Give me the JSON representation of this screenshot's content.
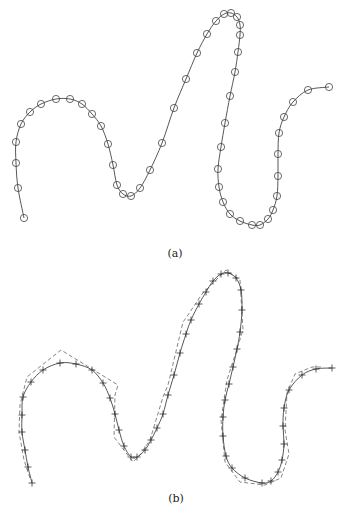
{
  "figure": {
    "panels": [
      {
        "id": "a",
        "caption": "(a)",
        "caption_pos": [
          175,
          255
        ],
        "description": "Smooth curve with circle markers at sample points",
        "curve_points": [
          [
            24,
            218
          ],
          [
            18,
            188
          ],
          [
            16,
            163
          ],
          [
            16,
            142
          ],
          [
            21,
            124
          ],
          [
            30,
            112
          ],
          [
            41,
            104
          ],
          [
            56,
            99
          ],
          [
            70,
            99
          ],
          [
            82,
            104
          ],
          [
            92,
            114
          ],
          [
            101,
            126
          ],
          [
            108,
            144
          ],
          [
            113,
            165
          ],
          [
            117,
            185
          ],
          [
            123,
            194
          ],
          [
            131,
            196
          ],
          [
            140,
            188
          ],
          [
            150,
            170
          ],
          [
            162,
            143
          ],
          [
            174,
            108
          ],
          [
            186,
            79
          ],
          [
            197,
            53
          ],
          [
            207,
            34
          ],
          [
            216,
            21
          ],
          [
            224,
            14
          ],
          [
            231,
            13
          ],
          [
            237,
            17
          ],
          [
            240,
            25
          ],
          [
            240,
            35
          ],
          [
            238,
            52
          ],
          [
            235,
            72
          ],
          [
            230,
            96
          ],
          [
            225,
            123
          ],
          [
            221,
            147
          ],
          [
            218,
            169
          ],
          [
            219,
            187
          ],
          [
            223,
            202
          ],
          [
            230,
            214
          ],
          [
            240,
            221
          ],
          [
            252,
            225
          ],
          [
            260,
            225
          ],
          [
            268,
            219
          ],
          [
            273,
            210
          ],
          [
            277,
            196
          ],
          [
            278,
            176
          ],
          [
            278,
            154
          ],
          [
            279,
            133
          ],
          [
            284,
            117
          ],
          [
            293,
            102
          ],
          [
            308,
            90
          ],
          [
            329,
            87
          ]
        ],
        "marker": "circle",
        "marker_radius": 3.6
      },
      {
        "id": "b",
        "caption": "(b)",
        "caption_pos": [
          176,
          500
        ],
        "description": "Smooth curve with cross markers and dashed approximating polygon",
        "curve_points": [
          [
            32,
            483
          ],
          [
            28,
            467
          ],
          [
            25,
            450
          ],
          [
            22,
            432
          ],
          [
            22,
            415
          ],
          [
            23,
            397
          ],
          [
            31,
            382
          ],
          [
            43,
            370
          ],
          [
            60,
            363
          ],
          [
            76,
            364
          ],
          [
            92,
            370
          ],
          [
            103,
            383
          ],
          [
            110,
            398
          ],
          [
            115,
            414
          ],
          [
            119,
            430
          ],
          [
            124,
            446
          ],
          [
            131,
            457
          ],
          [
            137,
            457
          ],
          [
            145,
            450
          ],
          [
            151,
            440
          ],
          [
            157,
            428
          ],
          [
            163,
            414
          ],
          [
            168,
            395
          ],
          [
            174,
            375
          ],
          [
            180,
            353
          ],
          [
            186,
            334
          ],
          [
            191,
            320
          ],
          [
            199,
            304
          ],
          [
            206,
            292
          ],
          [
            213,
            281
          ],
          [
            221,
            274
          ],
          [
            228,
            273
          ],
          [
            236,
            278
          ],
          [
            241,
            290
          ],
          [
            242,
            310
          ],
          [
            240,
            332
          ],
          [
            237,
            349
          ],
          [
            233,
            367
          ],
          [
            229,
            384
          ],
          [
            225,
            400
          ],
          [
            223,
            417
          ],
          [
            223,
            436
          ],
          [
            226,
            456
          ],
          [
            232,
            468
          ],
          [
            245,
            478
          ],
          [
            262,
            483
          ],
          [
            271,
            481
          ],
          [
            278,
            472
          ],
          [
            282,
            460
          ],
          [
            284,
            444
          ],
          [
            283,
            426
          ],
          [
            284,
            408
          ],
          [
            289,
            390
          ],
          [
            302,
            375
          ],
          [
            316,
            369
          ],
          [
            332,
            368
          ]
        ],
        "dashed_polygon": [
          [
            30,
            478
          ],
          [
            24,
            460
          ],
          [
            19,
            432
          ],
          [
            20,
            405
          ],
          [
            27,
            377
          ],
          [
            61,
            350
          ],
          [
            118,
            385
          ],
          [
            115,
            395
          ],
          [
            114,
            437
          ],
          [
            133,
            462
          ],
          [
            140,
            455
          ],
          [
            150,
            440
          ],
          [
            163,
            397
          ],
          [
            168,
            385
          ],
          [
            183,
            322
          ],
          [
            186,
            318
          ],
          [
            202,
            294
          ],
          [
            226,
            270
          ],
          [
            240,
            280
          ],
          [
            243,
            330
          ],
          [
            227,
            380
          ],
          [
            221,
            420
          ],
          [
            225,
            462
          ],
          [
            240,
            482
          ],
          [
            265,
            485
          ],
          [
            281,
            478
          ],
          [
            289,
            454
          ],
          [
            285,
            430
          ],
          [
            287,
            393
          ],
          [
            295,
            374
          ],
          [
            312,
            367
          ],
          [
            322,
            367
          ]
        ],
        "marker": "cross",
        "marker_size": 3.5
      }
    ]
  }
}
